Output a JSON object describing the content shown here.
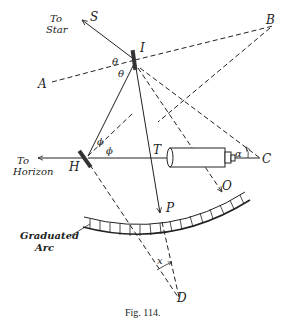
{
  "figure": {
    "caption": "Fig. 114."
  },
  "labels": {
    "to_star_line1": "To",
    "to_star_line2": "Star",
    "to_horizon_line1": "To",
    "to_horizon_line2": "Horizon",
    "graduated_arc_line1": "Graduated",
    "graduated_arc_line2": "Arc",
    "S": "S",
    "B": "B",
    "I": "I",
    "A": "A",
    "H": "H",
    "T": "T",
    "C": "C",
    "P": "P",
    "O": "O",
    "D": "D",
    "theta1": "θ",
    "theta2": "θ",
    "phi1": "ϕ",
    "phi2": "ϕ",
    "alpha": "α",
    "x": "x"
  },
  "colors": {
    "ink": "#222222",
    "background": "#ffffff"
  }
}
